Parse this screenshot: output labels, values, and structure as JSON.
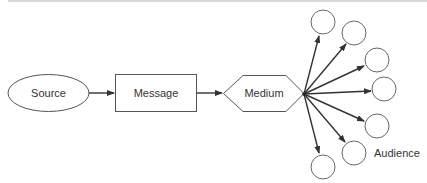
{
  "diagram": {
    "type": "communication-model",
    "nodes": {
      "source": {
        "label": "Source",
        "shape": "ellipse"
      },
      "message": {
        "label": "Message",
        "shape": "rectangle"
      },
      "medium": {
        "label": "Medium",
        "shape": "hexagon"
      }
    },
    "audience": {
      "label": "Audience",
      "count": 7,
      "shape": "circle"
    },
    "flow": [
      "Source",
      "Message",
      "Medium",
      "Audience"
    ],
    "colors": {
      "stroke": "#555555",
      "arrow": "#333333",
      "text": "#333333",
      "background": "#ffffff"
    }
  }
}
